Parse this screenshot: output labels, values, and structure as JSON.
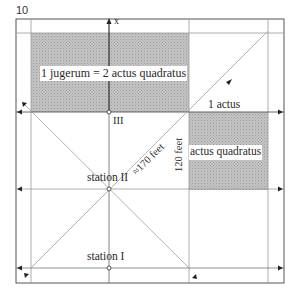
{
  "page": {
    "number": "10"
  },
  "diagram": {
    "labels": {
      "axis_x": "x",
      "jugerum_equation": "1 jugerum = 2 actus quadratus",
      "point_three": "III",
      "one_actus": "1 actus",
      "actus_quadratus": "actus quadratus",
      "diagonal_length": "≈170 feet",
      "side_length": "120 feet",
      "station_two": "station II",
      "station_one": "station I"
    },
    "colors": {
      "frame": "#555555",
      "grid_line": "#aaaaaa",
      "shade": "#bdbdbd",
      "axis": "#222222",
      "text": "#2a2a2a"
    }
  }
}
